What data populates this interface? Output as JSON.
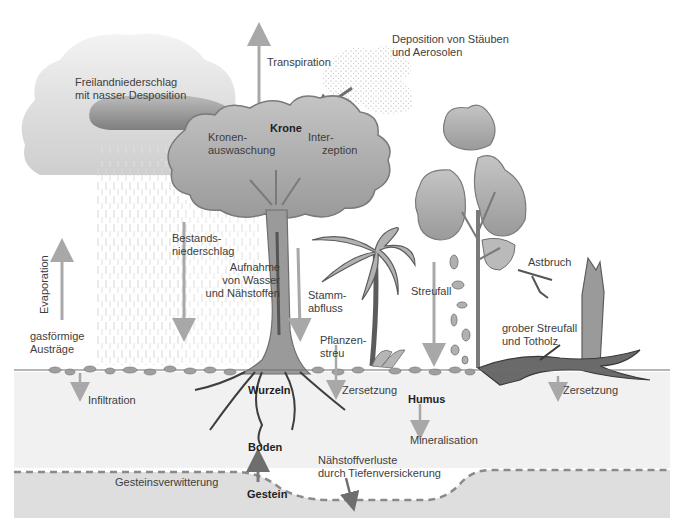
{
  "diagram": {
    "colors": {
      "background": "#ffffff",
      "soil": "#f0f0f0",
      "bedrock": "#dcdcdc",
      "bedrock_boundary": "#8a8a8a",
      "arrow": "#a8a8a8",
      "arrow_dark": "#6e6e6e",
      "foliage": "#a9a9a9",
      "foliage_dark": "#8a8a8a",
      "cloud_light": "#e3e3e3",
      "cloud_dark": "#8f8f8f",
      "trunk": "#8c8c8c",
      "deadwood": "#555555"
    },
    "labels": {
      "freilandniederschlag": [
        "Freilandniederschlag",
        "mit nasser Desposition"
      ],
      "transpiration": "Transpiration",
      "deposition": [
        "Deposition von Stäuben",
        "und Aerosolen"
      ],
      "krone": "Krone",
      "kronenauswaschung": [
        "Kronen-",
        "auswaschung"
      ],
      "interzeption": [
        "Inter-",
        "zeption"
      ],
      "bestandsniederschlag": [
        "Bestands-",
        "niederschlag"
      ],
      "evaporation": "Evaporation",
      "gasfoermige_austraege": [
        "gasförmige",
        "Austräge"
      ],
      "aufnahme": [
        "Aufnahme",
        "von Wasser",
        "und Nähstoffen"
      ],
      "stammabfluss": [
        "Stamm-",
        "abfluss"
      ],
      "streufall": "Streufall",
      "astbruch": "Astbruch",
      "pflanzenstreu": [
        "Pflanzen-",
        "streu"
      ],
      "grober_streufall": [
        "grober Streufall",
        "und Totholz"
      ],
      "infiltration": "Infiltration",
      "wurzeln": "Wurzeln",
      "zersetzung_1": "Zersetzung",
      "zersetzung_2": "Zersetzung",
      "humus": "Humus",
      "mineralisation": "Mineralisation",
      "boden": "Boden",
      "naehrstoffverluste": [
        "Nähstoffverluste",
        "durch Tiefenversickerung"
      ],
      "gesteinsverwitterung": "Gesteinsverwitterung",
      "gestein": "Gestein"
    }
  }
}
